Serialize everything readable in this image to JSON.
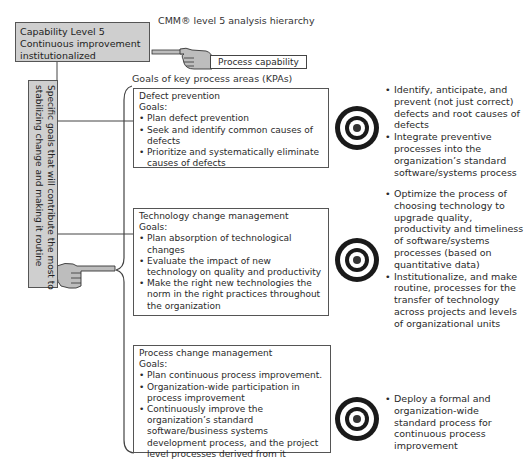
{
  "diagram": {
    "title": "CMM® level 5 analysis hierarchy",
    "capability_box": {
      "lines": [
        "Capability Level 5",
        "Continuous improvement",
        "institutionalized"
      ]
    },
    "process_capability_label": "Process capability",
    "kpa_section_label": "Goals of key process areas (KPAs)",
    "side_box": {
      "lines": [
        "Specific goals that will contribute the most to",
        "stabilizing change and making it routine"
      ]
    },
    "icons": {
      "pointing_hand_top": "pointing-hand-icon",
      "pointing_hand_side": "pointing-hand-icon",
      "target": "target-icon"
    },
    "colors": {
      "box_fill": "#cfcfcf",
      "border": "#555555",
      "target_ring": "#1a1a1a"
    },
    "kpas": [
      {
        "name": "Defect prevention",
        "goals_label": "Goals:",
        "goals": [
          "Plan defect prevention",
          "Seek and identify common causes of defects",
          "Prioritize and systematically eliminate causes of defects"
        ],
        "outcomes": [
          "Identify, anticipate, and prevent (not just correct) defects and root causes of defects",
          "Integrate preventive processes into the organization’s standard software/systems process"
        ]
      },
      {
        "name": "Technology change management",
        "goals_label": "Goals:",
        "goals": [
          "Plan absorption of technological changes",
          "Evaluate the impact of new technology on quality and productivity",
          "Make the right new technologies the norm in the right practices throughout the organization"
        ],
        "outcomes": [
          "Optimize the process of choosing technology to upgrade quality, productivity and timeliness of software/systems processes (based on quantitative data)",
          "Institutionalize, and make routine, processes for the transfer of technology across projects and levels of organizational units"
        ]
      },
      {
        "name": "Process change management",
        "goals_label": "Goals:",
        "goals": [
          "Plan continuous process improvement.",
          "Organization-wide participation in process improvement",
          "Continuously improve the organization’s standard software/business systems development process, and the project level processes derived from it"
        ],
        "outcomes": [
          "Deploy a formal and organization-wide standard process for continuous process improvement"
        ]
      }
    ]
  }
}
